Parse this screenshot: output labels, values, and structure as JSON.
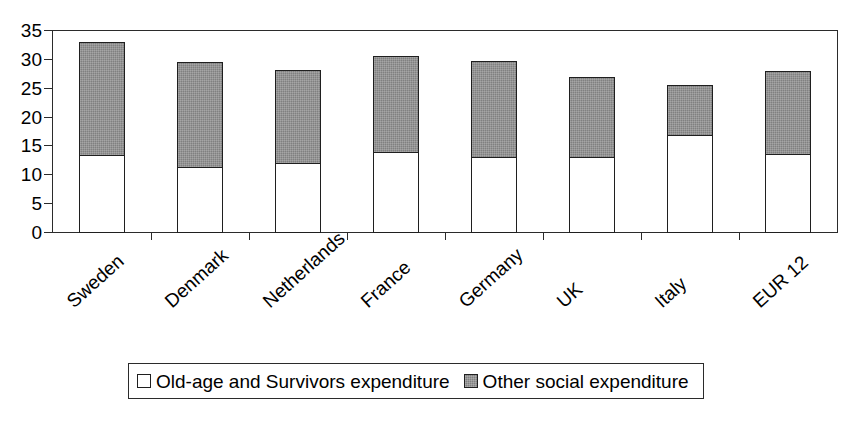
{
  "title_remnant": "ʒʒʒ",
  "chart_data": {
    "type": "bar",
    "stacked": true,
    "title": "",
    "subtitle": "",
    "xlabel": "",
    "ylabel": "",
    "ylim": [
      0,
      35
    ],
    "ytick_values": [
      0,
      5,
      10,
      15,
      20,
      25,
      30,
      35
    ],
    "ytick_labels": [
      "0",
      "5",
      "10",
      "15",
      "20",
      "25",
      "30",
      "35"
    ],
    "grid": false,
    "legend_position": "bottom",
    "categories": [
      "Sweden",
      "Denmark",
      "Netherlands",
      "France",
      "Germany",
      "UK",
      "Italy",
      "EUR 12"
    ],
    "series": [
      {
        "name": "Old-age and Survivors expenditure",
        "color": "#ffffff",
        "values": [
          13.3,
          11.2,
          11.9,
          13.8,
          12.9,
          12.9,
          16.7,
          13.5
        ]
      },
      {
        "name": "Other social expenditure",
        "color": "#808080",
        "values": [
          19.8,
          18.4,
          16.3,
          16.9,
          16.9,
          14.2,
          9.0,
          14.5
        ]
      }
    ],
    "totals": [
      33.1,
      29.6,
      28.2,
      30.7,
      29.8,
      27.1,
      25.7,
      28.0
    ]
  },
  "legend": {
    "items": [
      {
        "label": "Old-age and Survivors expenditure",
        "swatch": "white"
      },
      {
        "label": "Other social expenditure",
        "swatch": "gray"
      }
    ]
  }
}
